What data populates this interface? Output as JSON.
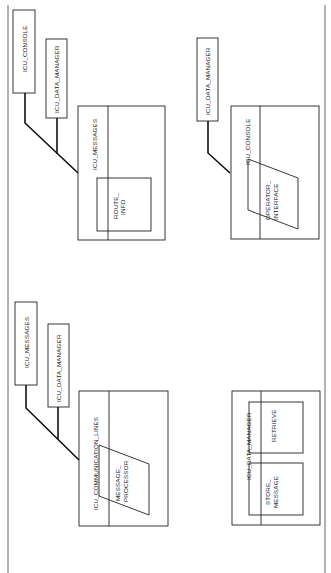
{
  "diagram": {
    "type": "module-structure-diagram",
    "orientation": "rotated-90-ccw",
    "colors": {
      "line": "#222222",
      "border": "#555555",
      "background": "#ffffff"
    },
    "modules": [
      {
        "id": "m1",
        "name": "ICU_MESSAGES",
        "imports": [
          "ICU_CONSOLE",
          "ICU_DATA_MANAGER"
        ],
        "inner": [
          {
            "shape": "rectangle",
            "label_line1": "ROUTE_",
            "label_line2": "INFO"
          }
        ]
      },
      {
        "id": "m2",
        "name": "ICU_CONSOLE",
        "imports": [
          "ICU_DATA_MANAGER"
        ],
        "inner": [
          {
            "shape": "parallelogram",
            "label_line1": "OPERATOR_",
            "label_line2": "INTERFACE"
          }
        ]
      },
      {
        "id": "m3",
        "name": "ICU_COMMUNICATION_LINES",
        "imports": [
          "ICU_MESSAGES",
          "ICU_DATA_MANAGER"
        ],
        "inner": [
          {
            "shape": "parallelogram",
            "label_line1": "MESSAGE_",
            "label_line2": "PROCESSOR"
          }
        ]
      },
      {
        "id": "m4",
        "name": "ICU_DATA_MANAGER",
        "imports": [],
        "inner": [
          {
            "shape": "rectangle",
            "label_line1": "RETRIEVE",
            "label_line2": ""
          },
          {
            "shape": "rectangle",
            "label_line1": "STORE_",
            "label_line2": "MESSAGE"
          }
        ]
      }
    ]
  }
}
